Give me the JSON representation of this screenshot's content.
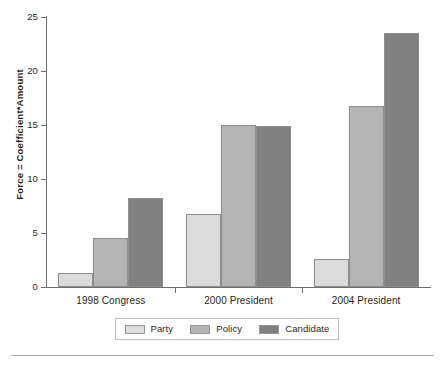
{
  "chart_data": {
    "type": "bar",
    "title": "",
    "subtitle": "",
    "xlabel": "",
    "ylabel": "Force = Coefficient*Amount",
    "ylim": [
      0,
      25
    ],
    "yticks": [
      0,
      5,
      10,
      15,
      20,
      25
    ],
    "ytick_labels": [
      "0",
      "5",
      "10",
      "15",
      "20",
      "25"
    ],
    "grid": false,
    "legend_position": "bottom",
    "categories": [
      "1998 Congress",
      "2000 President",
      "2004 President"
    ],
    "series": [
      {
        "name": "Party",
        "color": "#dcdcdc",
        "values": [
          1.3,
          6.8,
          2.6
        ]
      },
      {
        "name": "Policy",
        "color": "#b4b4b4",
        "values": [
          4.5,
          15.0,
          16.8
        ]
      },
      {
        "name": "Candidate",
        "color": "#808080",
        "values": [
          8.2,
          14.9,
          23.5
        ]
      }
    ]
  },
  "style": {
    "axis_color": "#6d6e71",
    "bar_border_color": "#8c8c8c",
    "legend_border_color": "#bcbec0",
    "rule_color": "#a7a9ac",
    "text_color": "#231f20",
    "background": "#ffffff"
  }
}
